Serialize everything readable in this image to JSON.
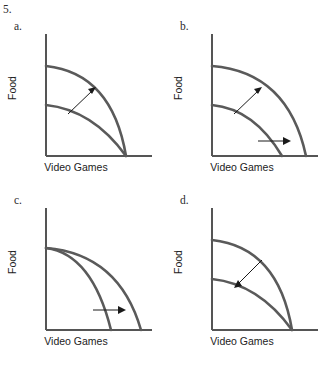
{
  "document": {
    "clipped_header_text": "·  ·  ·",
    "question_number": "5."
  },
  "axes": {
    "x_label": "Video Games",
    "y_label": "Food"
  },
  "colors": {
    "curve": "#5a5a5a",
    "axis": "#555555",
    "arrow": "#1a1a1a",
    "text": "#222222",
    "background": "#ffffff"
  },
  "panels": [
    {
      "id": "a",
      "label": "a.",
      "x_label": "Video Games",
      "y_label": "Food",
      "description": "Outward shift in Food only: both curves share the same Video Games intercept, outer curve has higher Food intercept. Arrow points up-right (outward).",
      "curves": [
        {
          "name": "inner-ppf",
          "y_intercept_px": 85,
          "x_intercept_px": 126
        },
        {
          "name": "outer-ppf",
          "y_intercept_px": 46,
          "x_intercept_px": 126
        }
      ],
      "arrows": [
        {
          "name": "outward-arrow",
          "x1": 68,
          "y1": 94,
          "x2": 95,
          "y2": 68,
          "direction": "up-right"
        }
      ]
    },
    {
      "id": "b",
      "label": "b.",
      "x_label": "Video Games",
      "y_label": "Food",
      "description": "Outward shift in both goods: outer curve has higher Food intercept and larger Video Games intercept. Two arrows, one up-right and one pointing right.",
      "curves": [
        {
          "name": "inner-ppf",
          "y_intercept_px": 85,
          "x_intercept_px": 116
        },
        {
          "name": "outer-ppf",
          "y_intercept_px": 46,
          "x_intercept_px": 140
        }
      ],
      "arrows": [
        {
          "name": "outward-arrow-food",
          "x1": 68,
          "y1": 94,
          "x2": 95,
          "y2": 68,
          "direction": "up-right"
        },
        {
          "name": "outward-arrow-games",
          "x1": 92,
          "y1": 121,
          "x2": 124,
          "y2": 121,
          "direction": "right"
        }
      ]
    },
    {
      "id": "c",
      "label": "c.",
      "x_label": "Video Games",
      "y_label": "Food",
      "description": "Outward shift in Video Games only: both curves share the same Food intercept, outer curve has larger Video Games intercept. Arrow points right (outward).",
      "curves": [
        {
          "name": "inner-ppf",
          "y_intercept_px": 54,
          "x_intercept_px": 111
        },
        {
          "name": "outer-ppf",
          "y_intercept_px": 54,
          "x_intercept_px": 141
        }
      ],
      "arrows": [
        {
          "name": "outward-arrow-games",
          "x1": 93,
          "y1": 116,
          "x2": 125,
          "y2": 116,
          "direction": "right"
        }
      ]
    },
    {
      "id": "d",
      "label": "d.",
      "x_label": "Video Games",
      "y_label": "Food",
      "description": "Inward shift in Food only: both curves share the same Video Games intercept, outer curve has higher Food intercept. Arrow points down-left (inward).",
      "curves": [
        {
          "name": "inner-ppf",
          "y_intercept_px": 85,
          "x_intercept_px": 126
        },
        {
          "name": "outer-ppf",
          "y_intercept_px": 46,
          "x_intercept_px": 126
        }
      ],
      "arrows": [
        {
          "name": "inward-arrow",
          "x1": 96,
          "y1": 66,
          "x2": 69,
          "y2": 93,
          "direction": "down-left"
        }
      ]
    }
  ],
  "geometry": {
    "origin_x_px": 46,
    "baseline_y_px": 136,
    "y_axis_top_px": 14,
    "x_axis_right_px": 152
  }
}
